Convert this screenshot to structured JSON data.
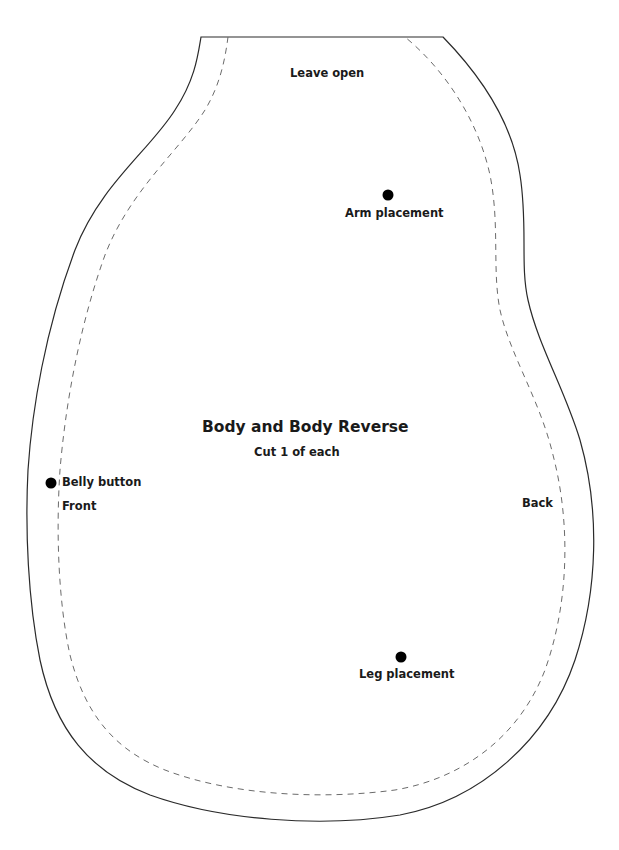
{
  "pattern": {
    "title": "Body and Body Reverse",
    "subtitle": "Cut 1 of each",
    "labels": {
      "leave_open": "Leave open",
      "arm_placement": "Arm placement",
      "belly_button": "Belly button",
      "front": "Front",
      "back": "Back",
      "leg_placement": "Leg placement"
    },
    "markers": [
      "arm-placement",
      "belly-button",
      "leg-placement"
    ],
    "colors": {
      "cut_line": "#2a2a2a",
      "seam_line": "#6b6b6b",
      "marker": "#000000",
      "text": "#1a1a1a",
      "background": "#ffffff"
    }
  }
}
